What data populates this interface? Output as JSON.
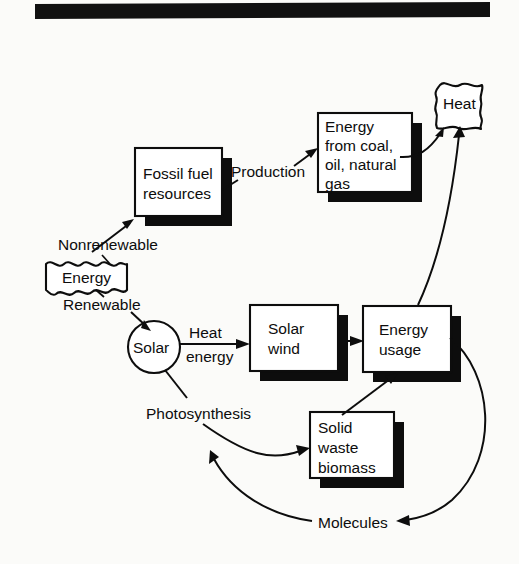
{
  "figure": {
    "header_bar": {
      "name": "top-black-bar",
      "color": "#111111"
    },
    "background_color": "#fbfbf9",
    "line_color": "#0d0d0d",
    "box_fill": "#ffffff"
  },
  "nodes": [
    {
      "id": "energy",
      "label_lines": [
        "Energy"
      ],
      "shape": "wavy-box"
    },
    {
      "id": "fossil_fuel",
      "label_lines": [
        "Fossil fuel",
        "resources"
      ],
      "shape": "shadow-box"
    },
    {
      "id": "energy_from_fuels",
      "label_lines": [
        "Energy",
        "from coal,",
        "oil, natural",
        "gas"
      ],
      "shape": "shadow-box"
    },
    {
      "id": "heat",
      "label_lines": [
        "Heat"
      ],
      "shape": "wavy-cloud"
    },
    {
      "id": "solar",
      "label_lines": [
        "Solar"
      ],
      "shape": "circle"
    },
    {
      "id": "solar_wind",
      "label_lines": [
        "Solar",
        "wind"
      ],
      "shape": "shadow-box"
    },
    {
      "id": "energy_usage",
      "label_lines": [
        "Energy",
        "usage"
      ],
      "shape": "shadow-box"
    },
    {
      "id": "solid_waste",
      "label_lines": [
        "Solid",
        "waste",
        "biomass"
      ],
      "shape": "shadow-box"
    }
  ],
  "edges": [
    {
      "id": "e1",
      "from": "energy",
      "to": "fossil_fuel",
      "label": "Nonrenewable"
    },
    {
      "id": "e2",
      "from": "fossil_fuel",
      "to": "energy_from_fuels",
      "label": "Production"
    },
    {
      "id": "e3",
      "from": "energy_from_fuels",
      "to": "heat",
      "label": ""
    },
    {
      "id": "e4",
      "from": "energy",
      "to": "solar",
      "label": "Renewable"
    },
    {
      "id": "e5",
      "from": "solar",
      "to": "solar_wind",
      "label_lines": [
        "Heat",
        "energy"
      ]
    },
    {
      "id": "e6",
      "from": "solar_wind",
      "to": "energy_usage",
      "label": ""
    },
    {
      "id": "e7",
      "from": "solar",
      "to": "solid_waste",
      "label": "Photosynthesis"
    },
    {
      "id": "e8",
      "from": "solid_waste",
      "to": "energy_usage",
      "label": ""
    },
    {
      "id": "e9",
      "from": "energy_usage",
      "to": "heat",
      "label": ""
    },
    {
      "id": "e10",
      "from": "energy_usage",
      "to": "molecules",
      "label": "Molecules"
    },
    {
      "id": "e11",
      "from": "molecules",
      "to": "photosynthesis_path",
      "label": ""
    }
  ],
  "labels": {
    "energy": "Energy",
    "fossil_fuel_l1": "Fossil fuel",
    "fossil_fuel_l2": "resources",
    "energy_fuels_l1": "Energy",
    "energy_fuels_l2": "from coal,",
    "energy_fuels_l3": "oil, natural",
    "energy_fuels_l4": "gas",
    "heat": "Heat",
    "solar": "Solar",
    "solar_wind_l1": "Solar",
    "solar_wind_l2": "wind",
    "energy_usage_l1": "Energy",
    "energy_usage_l2": "usage",
    "solid_waste_l1": "Solid",
    "solid_waste_l2": "waste",
    "solid_waste_l3": "biomass",
    "nonrenewable": "Nonrenewable",
    "renewable": "Renewable",
    "production": "Production",
    "heat_energy_l1": "Heat",
    "heat_energy_l2": "energy",
    "photosynthesis": "Photosynthesis",
    "molecules": "Molecules"
  }
}
